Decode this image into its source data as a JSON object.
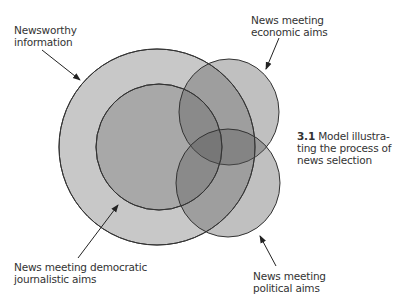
{
  "diagram": {
    "type": "venn",
    "colors": {
      "outer_fill": "#c8c8c8",
      "inner_fill": "#a6a6a6",
      "economic_fill": "#8c8c8c",
      "political_fill": "#8c8c8c",
      "stroke": "#333333"
    },
    "sets": [
      {
        "id": "newsworthy",
        "label_lines": [
          "Newsworthy",
          "information"
        ]
      },
      {
        "id": "democratic",
        "label_lines": [
          "News meeting democratic",
          "journalistic aims"
        ]
      },
      {
        "id": "economic",
        "label_lines": [
          "News meeting",
          "economic aims"
        ]
      },
      {
        "id": "political",
        "label_lines": [
          "News meeting",
          "political aims"
        ]
      }
    ]
  },
  "labels": {
    "newsworthy": {
      "line1": "Newsworthy",
      "line2": "information"
    },
    "economic": {
      "line1": "News meeting",
      "line2": "economic aims"
    },
    "democratic": {
      "line1": "News meeting democratic",
      "line2": "journalistic aims"
    },
    "political": {
      "line1": "News meeting",
      "line2": "political aims"
    }
  },
  "caption": {
    "number": "3.1",
    "line1": "Model illustra-",
    "line2": "ting the process of",
    "line3": "news selection"
  }
}
